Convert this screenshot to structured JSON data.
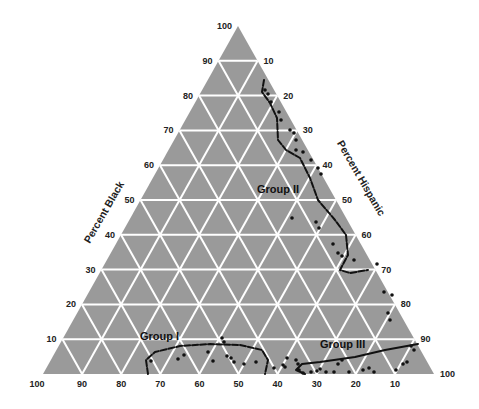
{
  "chart_data": {
    "type": "scatter",
    "subtype": "ternary",
    "title": "",
    "colors": {
      "triangle_fill": "#9a9a9a",
      "grid": "#ffffff",
      "points": "#111111",
      "boundary": "#111111"
    },
    "geometry": {
      "apex": [
        238,
        26
      ],
      "base_left": [
        43,
        374
      ],
      "base_right": [
        434,
        374
      ]
    },
    "axes": {
      "left": {
        "title": "Percent Black",
        "ticks": [
          10,
          20,
          30,
          40,
          50,
          60,
          70,
          80,
          90,
          100
        ]
      },
      "right": {
        "title": "Percent Hispanic",
        "ticks": [
          10,
          20,
          30,
          40,
          50,
          60,
          70,
          80,
          90,
          100
        ]
      },
      "bottom": {
        "title": "",
        "ticks": [
          100,
          90,
          80,
          70,
          60,
          50,
          40,
          30,
          20,
          10
        ]
      }
    },
    "grid": true,
    "grid_step": 10,
    "groups": [
      {
        "name": "Group I",
        "label_pos": [
          140,
          340
        ],
        "boundary": [
          [
            148,
            374
          ],
          [
            146,
            360
          ],
          [
            155,
            352
          ],
          [
            180,
            346
          ],
          [
            210,
            344
          ],
          [
            240,
            345
          ],
          [
            262,
            350
          ],
          [
            268,
            360
          ],
          [
            265,
            374
          ]
        ]
      },
      {
        "name": "Group II",
        "label_pos": [
          257,
          193
        ],
        "boundary": [
          [
            264,
            80
          ],
          [
            262,
            92
          ],
          [
            270,
            103
          ],
          [
            277,
            118
          ],
          [
            278,
            140
          ],
          [
            286,
            150
          ],
          [
            300,
            158
          ],
          [
            310,
            178
          ],
          [
            318,
            200
          ],
          [
            335,
            220
          ],
          [
            346,
            235
          ],
          [
            348,
            255
          ],
          [
            340,
            270
          ],
          [
            350,
            273
          ],
          [
            368,
            270
          ]
        ]
      },
      {
        "name": "Group III",
        "label_pos": [
          320,
          348
        ],
        "boundary": [
          [
            305,
            374
          ],
          [
            296,
            370
          ],
          [
            302,
            364
          ],
          [
            320,
            362
          ],
          [
            355,
            357
          ],
          [
            385,
            350
          ],
          [
            418,
            344
          ]
        ]
      }
    ],
    "points": [
      [
        265,
        90
      ],
      [
        268,
        94
      ],
      [
        271,
        102
      ],
      [
        279,
        112
      ],
      [
        281,
        120
      ],
      [
        290,
        130
      ],
      [
        294,
        133
      ],
      [
        296,
        140
      ],
      [
        303,
        152
      ],
      [
        311,
        160
      ],
      [
        318,
        168
      ],
      [
        321,
        174
      ],
      [
        296,
        150
      ],
      [
        292,
        218
      ],
      [
        316,
        222
      ],
      [
        319,
        228
      ],
      [
        333,
        244
      ],
      [
        338,
        253
      ],
      [
        342,
        256
      ],
      [
        354,
        260
      ],
      [
        384,
        292
      ],
      [
        392,
        295
      ],
      [
        377,
        264
      ],
      [
        388,
        313
      ],
      [
        390,
        320
      ],
      [
        411,
        346
      ],
      [
        414,
        350
      ],
      [
        403,
        364
      ],
      [
        396,
        370
      ],
      [
        407,
        362
      ],
      [
        222,
        338
      ],
      [
        224,
        342
      ],
      [
        151,
        361
      ],
      [
        178,
        359
      ],
      [
        184,
        355
      ],
      [
        208,
        352
      ],
      [
        213,
        361
      ],
      [
        227,
        356
      ],
      [
        231,
        358
      ],
      [
        234,
        362
      ],
      [
        244,
        364
      ],
      [
        256,
        362
      ],
      [
        274,
        368
      ],
      [
        283,
        365
      ],
      [
        287,
        358
      ],
      [
        285,
        367
      ],
      [
        296,
        360
      ],
      [
        298,
        364
      ],
      [
        299,
        370
      ],
      [
        303,
        373
      ],
      [
        311,
        372
      ],
      [
        317,
        371
      ],
      [
        320,
        369
      ],
      [
        326,
        372
      ],
      [
        334,
        372
      ],
      [
        338,
        364
      ],
      [
        342,
        360
      ],
      [
        349,
        372
      ],
      [
        363,
        370
      ],
      [
        369,
        368
      ],
      [
        374,
        372
      ]
    ]
  }
}
